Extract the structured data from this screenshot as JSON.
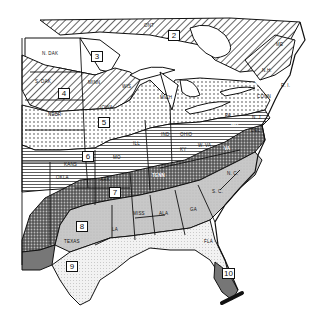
{
  "map": {
    "title": "Eastern United States hardiness zones",
    "zones": [
      {
        "id": "2",
        "label": "2"
      },
      {
        "id": "3",
        "label": "3"
      },
      {
        "id": "4",
        "label": "4"
      },
      {
        "id": "5",
        "label": "5"
      },
      {
        "id": "6",
        "label": "6"
      },
      {
        "id": "7",
        "label": "7"
      },
      {
        "id": "8",
        "label": "8"
      },
      {
        "id": "9",
        "label": "9"
      },
      {
        "id": "10",
        "label": "10"
      }
    ],
    "states": {
      "ndak": "N. DAK",
      "sdak": "S. DAK",
      "minn": "MINN",
      "wis": "WIS",
      "iowa": "IOWA",
      "nebr": "NEBR",
      "kans": "KANS",
      "mo": "MO",
      "okla": "OKLA",
      "ark": "ARK",
      "texas": "TEXAS",
      "la": "LA",
      "miss": "MISS",
      "ala": "ALA",
      "ga": "GA",
      "fla": "FLA",
      "sc": "S. C.",
      "nc": "N. C.",
      "tenn": "TENN",
      "ky": "KY",
      "va": "VA",
      "wva": "W. VA",
      "ill": "ILL",
      "ind": "IND",
      "ohio": "OHIO",
      "mich": "MICH",
      "pa": "PA",
      "nj": "N. J.",
      "del": "DEL",
      "md": "MD",
      "conn": "CONN",
      "mass": "MASS",
      "ri": "R. I.",
      "nh": "N.H.",
      "me": "ME",
      "vt": "VT",
      "ny": "N.Y.",
      "ont": "ONT"
    }
  }
}
